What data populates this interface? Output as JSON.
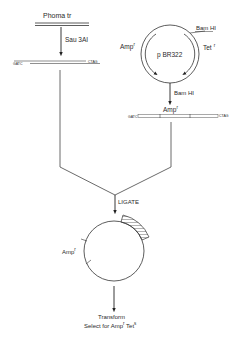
{
  "diagram": {
    "left_branch": {
      "source_label": "Phoma tr",
      "enzyme_label": "Sau 3AI",
      "fragment_left_end": "GATC",
      "fragment_right_end": "CTAG"
    },
    "right_branch": {
      "plasmid_label": "p BR322",
      "site_label": "Bam HI",
      "amp_label": "Amp",
      "amp_sup": "r",
      "tet_label": "Tet",
      "tet_sup": "r",
      "enzyme_label": "Bam HI",
      "linear_amp_label": "Amp",
      "linear_amp_sup": "r",
      "fragment_left_end": "GATC",
      "fragment_right_end": "CTAG"
    },
    "merge": {
      "step_label": "LIGATE"
    },
    "product": {
      "amp_label": "Amp",
      "amp_sup": "r"
    },
    "final": {
      "line1": "Transform",
      "line2_prefix": "Select for Amp",
      "line2_amp_sup": "r",
      "line2_tet": " Tet",
      "line2_tet_sup": "s"
    }
  }
}
